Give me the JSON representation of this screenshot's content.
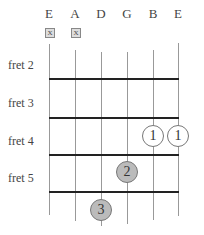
{
  "strings": [
    {
      "label": "E",
      "muted": true
    },
    {
      "label": "A",
      "muted": true
    },
    {
      "label": "D",
      "muted": false
    },
    {
      "label": "G",
      "muted": false
    },
    {
      "label": "B",
      "muted": false
    },
    {
      "label": "E",
      "muted": false
    }
  ],
  "mute_symbol": "X",
  "frets": [
    {
      "label": "fret 2"
    },
    {
      "label": "fret 3"
    },
    {
      "label": "fret 4"
    },
    {
      "label": "fret 5"
    }
  ],
  "fingerings": [
    {
      "string": "B",
      "fret": 4,
      "finger": "1",
      "style": "open"
    },
    {
      "string": "E",
      "fret": 4,
      "finger": "1",
      "style": "open"
    },
    {
      "string": "G",
      "fret": 5,
      "finger": "2",
      "style": "filled"
    },
    {
      "string": "D",
      "fret": 6,
      "finger": "3",
      "style": "filled"
    }
  ],
  "colors": {
    "open_dot": "#ffffff",
    "filled_dot": "#bbbbbb",
    "fret_line": "#222222",
    "string_line": "#999999"
  }
}
